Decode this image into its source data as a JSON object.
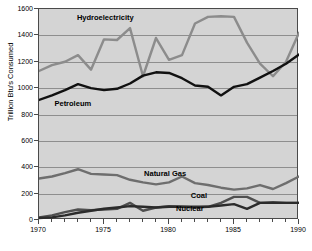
{
  "chart": {
    "title": "U.S. Energy Consumption by Source",
    "plot_bg": "#d4d4d4",
    "frame_color": "#4a4a4a",
    "grid_color": "#8e8e8e"
  },
  "chart_data": {
    "type": "line",
    "title": "U.S. Energy Consumption by Source",
    "xlabel": "",
    "ylabel": "Trillion Btu's Consumed",
    "xlim": [
      1970,
      1990
    ],
    "ylim": [
      0,
      1600
    ],
    "grid": true,
    "legend": "in-plot annotations",
    "x": [
      1970,
      1971,
      1972,
      1973,
      1974,
      1975,
      1976,
      1977,
      1978,
      1979,
      1980,
      1981,
      1982,
      1983,
      1984,
      1985,
      1986,
      1987,
      1988,
      1989,
      1990
    ],
    "yticks": [
      0,
      200,
      400,
      600,
      800,
      1000,
      1200,
      1400,
      1600
    ],
    "xticks_major": [
      1970,
      1975,
      1980,
      1985,
      1990
    ],
    "series": [
      {
        "name": "Hydroelectricity",
        "color": "#8c8c8c",
        "label_x": 1975.1,
        "label_y": 1530,
        "values": [
          1130,
          1175,
          1200,
          1250,
          1140,
          1370,
          1365,
          1455,
          1090,
          1380,
          1215,
          1250,
          1490,
          1540,
          1545,
          1540,
          1345,
          1185,
          1090,
          1200,
          1420
        ]
      },
      {
        "name": "Petroleum",
        "color": "#111111",
        "label_x": 1972.6,
        "label_y": 880,
        "values": [
          910,
          945,
          985,
          1030,
          1000,
          985,
          995,
          1035,
          1095,
          1120,
          1115,
          1075,
          1020,
          1010,
          945,
          1010,
          1030,
          1080,
          1130,
          1185,
          1255
        ]
      },
      {
        "name": "Natural Gas",
        "color": "#6e6e6e",
        "label_x": 1979.7,
        "label_y": 350,
        "values": [
          315,
          330,
          355,
          385,
          350,
          345,
          340,
          305,
          285,
          270,
          285,
          330,
          280,
          265,
          245,
          230,
          240,
          265,
          235,
          280,
          330
        ]
      },
      {
        "name": "Coal",
        "color": "#4f4f4f",
        "label_x": 1982.3,
        "label_y": 185,
        "values": [
          20,
          35,
          60,
          80,
          75,
          80,
          85,
          130,
          70,
          95,
          105,
          100,
          95,
          100,
          130,
          175,
          175,
          130,
          135,
          130,
          130
        ]
      },
      {
        "name": "Nuclear",
        "color": "#2b2b2b",
        "label_x": 1981.6,
        "label_y": 80,
        "values": [
          15,
          20,
          35,
          55,
          70,
          85,
          95,
          105,
          100,
          95,
          100,
          100,
          100,
          100,
          110,
          120,
          85,
          130,
          130,
          130,
          130
        ]
      }
    ]
  }
}
